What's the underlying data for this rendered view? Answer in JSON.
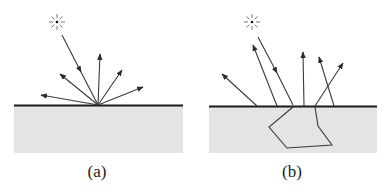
{
  "figure": {
    "panels": [
      {
        "id": "a",
        "label": "(a)",
        "description": "Diffuse reflection at surface"
      },
      {
        "id": "b",
        "label": "(b)",
        "description": "Subsurface scattering"
      }
    ],
    "colors": {
      "surface_fill": "#e4e4e4",
      "surface_line": "#1a1a1a",
      "ray": "#3a3a3a",
      "background": "#ffffff"
    }
  }
}
